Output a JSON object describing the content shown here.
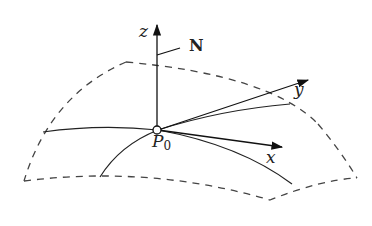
{
  "figure": {
    "labels": {
      "z_axis": "z",
      "normal": "N",
      "y_axis": "y",
      "x_axis": "x",
      "point_main": "P",
      "point_sub": "0"
    },
    "colors": {
      "stroke": "#222222",
      "dashed": "#444444",
      "background": "#ffffff"
    }
  }
}
